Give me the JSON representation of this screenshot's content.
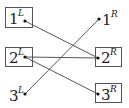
{
  "diagram": {
    "left_nodes": [
      {
        "id": "1L",
        "number": "1",
        "superscript": "L",
        "boxed": true
      },
      {
        "id": "2L",
        "number": "2",
        "superscript": "L",
        "boxed": true
      },
      {
        "id": "3L",
        "number": "3",
        "superscript": "L",
        "boxed": false
      }
    ],
    "right_nodes": [
      {
        "id": "1R",
        "number": "1",
        "superscript": "R",
        "boxed": false
      },
      {
        "id": "2R",
        "number": "2",
        "superscript": "R",
        "boxed": true
      },
      {
        "id": "3R",
        "number": "3",
        "superscript": "R",
        "boxed": true
      }
    ],
    "edges": [
      {
        "from": "1L",
        "to": "2R"
      },
      {
        "from": "2L",
        "to": "2R"
      },
      {
        "from": "2L",
        "to": "3R"
      },
      {
        "from": "3L",
        "to": "1R"
      }
    ],
    "colors": {
      "line": "#444444",
      "dot": "#111111",
      "box": "#555555"
    }
  }
}
